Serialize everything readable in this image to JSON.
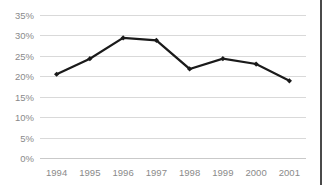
{
  "chart_data": {
    "type": "line",
    "title": "",
    "subtitle": "",
    "xlabel": "",
    "ylabel": "",
    "categories": [
      "1994",
      "1995",
      "1996",
      "1997",
      "1998",
      "1999",
      "2000",
      "2001"
    ],
    "values": [
      20.5,
      24.3,
      29.4,
      28.8,
      21.8,
      24.3,
      23.0,
      18.9
    ],
    "series": [
      {
        "name": "",
        "values": [
          20.5,
          24.3,
          29.4,
          28.8,
          21.8,
          24.3,
          23.0,
          18.9
        ]
      }
    ],
    "ylim": [
      0,
      35
    ],
    "ytick_labels": [
      "0%",
      "5%",
      "10%",
      "15%",
      "20%",
      "25%",
      "30%",
      "35%"
    ],
    "ytick_values": [
      0,
      5,
      10,
      15,
      20,
      25,
      30,
      35
    ],
    "xtick_labels": [
      "1994",
      "1995",
      "1996",
      "1997",
      "1998",
      "1999",
      "2000",
      "2001"
    ],
    "grid": "horizontal",
    "legend": "none",
    "annotations": [],
    "colors": {
      "line": "#1a1a1a",
      "marker": "#1a1a1a",
      "gridline": "#d9d9d9",
      "tick_label": "#8a8a8a",
      "background": "#ffffff",
      "border": "#4a4a4a"
    }
  },
  "axes": {
    "y_label_0": "0%",
    "y_label_1": "5%",
    "y_label_2": "10%",
    "y_label_3": "15%",
    "y_label_4": "20%",
    "y_label_5": "25%",
    "y_label_6": "30%",
    "y_label_7": "35%",
    "x_label_0": "1994",
    "x_label_1": "1995",
    "x_label_2": "1996",
    "x_label_3": "1997",
    "x_label_4": "1998",
    "x_label_5": "1999",
    "x_label_6": "2000",
    "x_label_7": "2001"
  }
}
